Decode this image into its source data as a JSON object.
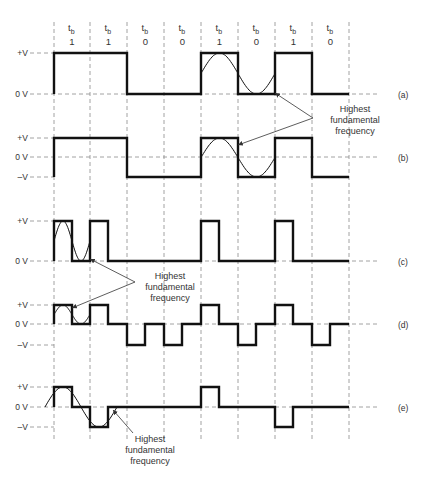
{
  "header": {
    "bit_period_label": "t",
    "bit_period_sub": "b",
    "bits": [
      "1",
      "1",
      "0",
      "0",
      "1",
      "0",
      "1",
      "0"
    ]
  },
  "grid": {
    "x_positions": [
      54,
      90,
      127,
      164,
      201,
      238,
      275,
      312,
      349
    ],
    "line_color": "#8a8a8a",
    "wave_color": "#111111"
  },
  "waveforms": [
    {
      "id": "a",
      "label": "(a)",
      "levels": {
        "+V": 53,
        "0 V": 94
      },
      "level_labels": [
        "+V",
        "0 V"
      ],
      "description": "Unipolar NRZ",
      "path": [
        [
          54,
          94
        ],
        [
          54,
          53
        ],
        [
          127,
          53
        ],
        [
          127,
          94
        ],
        [
          201,
          94
        ],
        [
          201,
          53
        ],
        [
          238,
          53
        ],
        [
          238,
          94
        ],
        [
          275,
          94
        ],
        [
          275,
          53
        ],
        [
          312,
          53
        ],
        [
          312,
          94
        ],
        [
          349,
          94
        ]
      ],
      "sine": {
        "x0": 201,
        "x1": 275,
        "top": 53,
        "bottom": 94
      }
    },
    {
      "id": "b",
      "label": "(b)",
      "levels": {
        "+V": 138,
        "0 V": 157,
        "–V": 177
      },
      "level_labels": [
        "+V",
        "0 V",
        "–V"
      ],
      "description": "Bipolar NRZ",
      "path": [
        [
          54,
          177
        ],
        [
          54,
          138
        ],
        [
          127,
          138
        ],
        [
          127,
          177
        ],
        [
          201,
          177
        ],
        [
          201,
          138
        ],
        [
          238,
          138
        ],
        [
          238,
          177
        ],
        [
          275,
          177
        ],
        [
          275,
          138
        ],
        [
          312,
          138
        ],
        [
          312,
          177
        ],
        [
          349,
          177
        ]
      ],
      "sine": {
        "x0": 201,
        "x1": 275,
        "top": 138,
        "bottom": 177
      }
    },
    {
      "id": "c",
      "label": "(c)",
      "levels": {
        "+V": 221,
        "0 V": 261
      },
      "level_labels": [
        "+V",
        "0 V"
      ],
      "description": "Unipolar RZ",
      "path": [
        [
          54,
          261
        ],
        [
          54,
          221
        ],
        [
          72,
          221
        ],
        [
          72,
          261
        ],
        [
          90,
          261
        ],
        [
          90,
          221
        ],
        [
          108,
          221
        ],
        [
          108,
          261
        ],
        [
          201,
          261
        ],
        [
          201,
          221
        ],
        [
          219,
          221
        ],
        [
          219,
          261
        ],
        [
          275,
          261
        ],
        [
          275,
          221
        ],
        [
          293,
          221
        ],
        [
          293,
          261
        ],
        [
          349,
          261
        ]
      ],
      "sine": {
        "x0": 54,
        "x1": 90,
        "top": 221,
        "bottom": 261
      }
    },
    {
      "id": "d",
      "label": "(d)",
      "levels": {
        "+V": 305,
        "0 V": 324,
        "–V": 345
      },
      "level_labels": [
        "+V",
        "0 V",
        "–V"
      ],
      "description": "Bipolar RZ",
      "path": [
        [
          54,
          324
        ],
        [
          54,
          305
        ],
        [
          72,
          305
        ],
        [
          72,
          324
        ],
        [
          90,
          324
        ],
        [
          90,
          305
        ],
        [
          108,
          305
        ],
        [
          108,
          324
        ],
        [
          127,
          324
        ],
        [
          127,
          345
        ],
        [
          145,
          345
        ],
        [
          145,
          324
        ],
        [
          164,
          324
        ],
        [
          164,
          345
        ],
        [
          182,
          345
        ],
        [
          182,
          324
        ],
        [
          201,
          324
        ],
        [
          201,
          305
        ],
        [
          219,
          305
        ],
        [
          219,
          324
        ],
        [
          238,
          324
        ],
        [
          238,
          345
        ],
        [
          256,
          345
        ],
        [
          256,
          324
        ],
        [
          275,
          324
        ],
        [
          275,
          305
        ],
        [
          293,
          305
        ],
        [
          293,
          324
        ],
        [
          312,
          324
        ],
        [
          312,
          345
        ],
        [
          330,
          345
        ],
        [
          330,
          324
        ],
        [
          349,
          324
        ]
      ],
      "sine": {
        "x0": 54,
        "x1": 90,
        "top": 305,
        "bottom": 324
      }
    },
    {
      "id": "e",
      "label": "(e)",
      "levels": {
        "+V": 387,
        "0 V": 407,
        "–V": 427
      },
      "level_labels": [
        "+V",
        "0 V",
        "–V"
      ],
      "description": "RZ-AMI",
      "path": [
        [
          54,
          407
        ],
        [
          54,
          387
        ],
        [
          72,
          387
        ],
        [
          72,
          407
        ],
        [
          90,
          407
        ],
        [
          90,
          427
        ],
        [
          108,
          427
        ],
        [
          108,
          407
        ],
        [
          201,
          407
        ],
        [
          201,
          387
        ],
        [
          219,
          387
        ],
        [
          219,
          407
        ],
        [
          275,
          407
        ],
        [
          275,
          427
        ],
        [
          293,
          427
        ],
        [
          293,
          407
        ],
        [
          349,
          407
        ]
      ],
      "sine": {
        "x0": 45,
        "x1": 117,
        "top": 387,
        "bottom": 427
      }
    }
  ],
  "annotations": [
    {
      "text": [
        "Highest",
        "fundamental",
        "frequency"
      ],
      "x": 355,
      "y": 112,
      "arrows": [
        [
          [
            313,
            118
          ],
          [
            275,
            93
          ]
        ],
        [
          [
            313,
            118
          ],
          [
            238,
            145
          ]
        ]
      ]
    },
    {
      "text": [
        "Highest",
        "fundamental",
        "frequency"
      ],
      "x": 170,
      "y": 279,
      "arrows": [
        [
          [
            135,
            282
          ],
          [
            90,
            259
          ]
        ],
        [
          [
            135,
            282
          ],
          [
            72,
            308
          ]
        ]
      ]
    },
    {
      "text": [
        "Highest",
        "fundamental",
        "frequency"
      ],
      "x": 150,
      "y": 442,
      "arrows": [
        [
          [
            133,
            433
          ],
          [
            113,
            410
          ]
        ]
      ]
    }
  ],
  "chart_data": {
    "type": "line",
    "bits": [
      1,
      1,
      0,
      0,
      1,
      0,
      1,
      0
    ],
    "x": [
      0,
      1,
      2,
      3,
      4,
      5,
      6,
      7
    ],
    "xlabel": "t_b (bit periods)",
    "ylabel": "Voltage",
    "series": [
      {
        "name": "(a) Unipolar NRZ",
        "levels": [
          "+V",
          "0 V"
        ],
        "values": [
          "+V",
          "+V",
          "0",
          "0",
          "+V",
          "0",
          "+V",
          "0"
        ]
      },
      {
        "name": "(b) Bipolar NRZ",
        "levels": [
          "+V",
          "0 V",
          "–V"
        ],
        "values": [
          "+V",
          "+V",
          "–V",
          "–V",
          "+V",
          "–V",
          "+V",
          "–V"
        ]
      },
      {
        "name": "(c) Unipolar RZ",
        "levels": [
          "+V",
          "0 V"
        ],
        "values": [
          "+V/0",
          "+V/0",
          "0",
          "0",
          "+V/0",
          "0",
          "+V/0",
          "0"
        ]
      },
      {
        "name": "(d) Bipolar RZ",
        "levels": [
          "+V",
          "0 V",
          "–V"
        ],
        "values": [
          "+V/0",
          "+V/0",
          "–V/0",
          "–V/0",
          "+V/0",
          "–V/0",
          "+V/0",
          "–V/0"
        ]
      },
      {
        "name": "(e) RZ-AMI",
        "levels": [
          "+V",
          "0 V",
          "–V"
        ],
        "values": [
          "+V/0",
          "–V/0",
          "0",
          "0",
          "+V/0",
          "0",
          "–V/0",
          "0"
        ]
      }
    ],
    "annotations": [
      "Highest fundamental frequency"
    ],
    "grid": true
  }
}
